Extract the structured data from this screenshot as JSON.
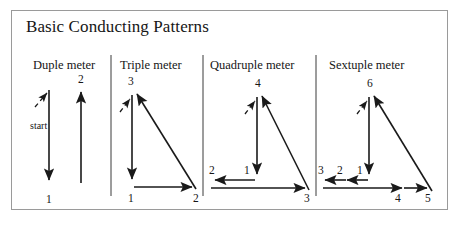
{
  "figure": {
    "title": "Basic Conducting Patterns",
    "border_color": "#9a9a9a",
    "stroke_color": "#1a1a1a",
    "background": "#ffffff"
  },
  "panels": [
    {
      "id": "duple",
      "header": "Duple meter",
      "start_label": "start",
      "beats": [
        "1",
        "2"
      ]
    },
    {
      "id": "triple",
      "header": "Triple meter",
      "beats": [
        "1",
        "2",
        "3"
      ]
    },
    {
      "id": "quadruple",
      "header": "Quadruple meter",
      "beats": [
        "1",
        "2",
        "3",
        "4"
      ]
    },
    {
      "id": "sextuple",
      "header": "Sextuple meter",
      "beats": [
        "1",
        "2",
        "3",
        "4",
        "5",
        "6"
      ]
    }
  ],
  "labels": {
    "duple_1": "1",
    "duple_2": "2",
    "duple_start": "start",
    "triple_1": "1",
    "triple_2": "2",
    "triple_3": "3",
    "quad_1": "1",
    "quad_2": "2",
    "quad_3": "3",
    "quad_4": "4",
    "sext_1": "1",
    "sext_2": "2",
    "sext_3": "3",
    "sext_4": "4",
    "sext_5": "5",
    "sext_6": "6"
  }
}
